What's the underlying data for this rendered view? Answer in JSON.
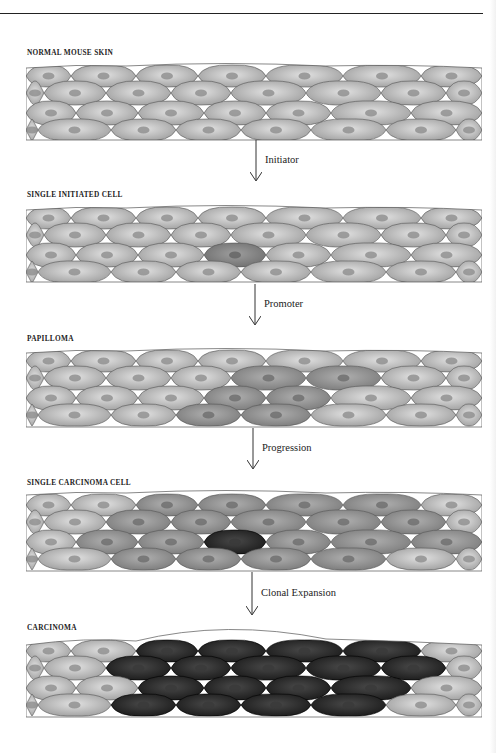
{
  "figure": {
    "stages": [
      {
        "id": "normal",
        "label": "NORMAL MOUSE SKIN"
      },
      {
        "id": "initiated",
        "label": "SINGLE INITIATED CELL"
      },
      {
        "id": "papilloma",
        "label": "PAPILLOMA"
      },
      {
        "id": "carcinoma-cell",
        "label": "SINGLE CARCINOMA CELL"
      },
      {
        "id": "carcinoma",
        "label": "CARCINOMA"
      }
    ],
    "transitions": [
      {
        "from": "normal",
        "to": "initiated",
        "label": "Initiator"
      },
      {
        "from": "initiated",
        "to": "papilloma",
        "label": "Promoter"
      },
      {
        "from": "papilloma",
        "to": "carcinoma-cell",
        "label": "Progression"
      },
      {
        "from": "carcinoma-cell",
        "to": "carcinoma",
        "label": "Clonal Expansion"
      }
    ],
    "colors": {
      "normal_cell": "#b4b4b4",
      "initiated_cell": "#7e7e7e",
      "papilloma_cell": "#8c8c8c",
      "carcinoma_cell": "#1a1a1a",
      "cell_border": "#555555",
      "arrow": "#333333"
    }
  }
}
